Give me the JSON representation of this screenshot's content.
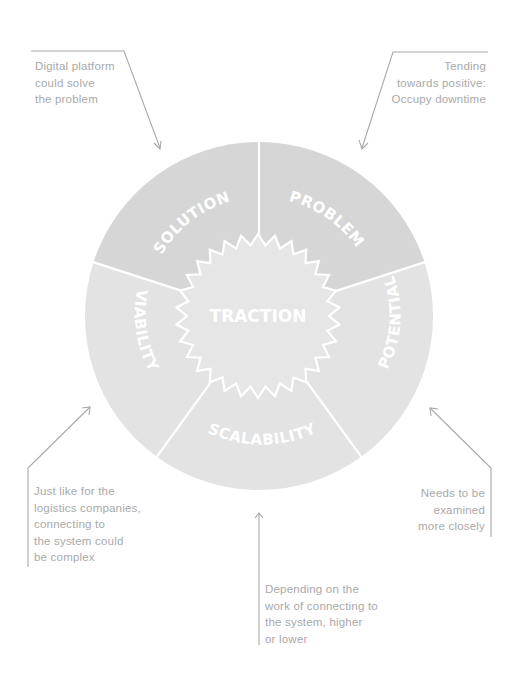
{
  "diagram": {
    "center_label": "TRACTION",
    "segments": [
      {
        "label": "SOLUTION",
        "color": "#d6d6d6"
      },
      {
        "label": "PROBLEM",
        "color": "#d6d6d6"
      },
      {
        "label": "POTENTIAL",
        "color": "#e3e3e3"
      },
      {
        "label": "SCALABILITY",
        "color": "#e3e3e3"
      },
      {
        "label": "VIABILITY",
        "color": "#e3e3e3"
      }
    ],
    "star_color": "#e6e6e6",
    "divider_color": "#ffffff",
    "annotation_color": "#a9a9a9"
  },
  "notes": {
    "solution": {
      "lines": [
        "Digital platform",
        "could solve",
        "the problem"
      ]
    },
    "problem": {
      "lines": [
        "Tending",
        "towards positive:",
        "Occupy downtime"
      ]
    },
    "viability": {
      "lines": [
        "Just like for the",
        "logistics companies,",
        "connecting to",
        "the system could",
        "be complex"
      ]
    },
    "potential": {
      "lines": [
        "Needs to be",
        "examined",
        "more closely"
      ]
    },
    "scalability": {
      "lines": [
        "Depending on the",
        "work of connecting to",
        "the system, higher",
        "or lower"
      ]
    }
  }
}
